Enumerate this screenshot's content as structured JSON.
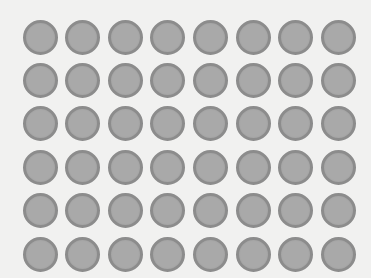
{
  "grid": {
    "rows": 6,
    "cols": 8,
    "origin_x": 40,
    "origin_y": 37,
    "step_x": 42.6,
    "step_y": 43.4,
    "diameter": 35
  },
  "colors": {
    "background": "#f1f1f0",
    "dot_fill": "#a9a9a9",
    "dot_ring": "#8c8c8c"
  }
}
